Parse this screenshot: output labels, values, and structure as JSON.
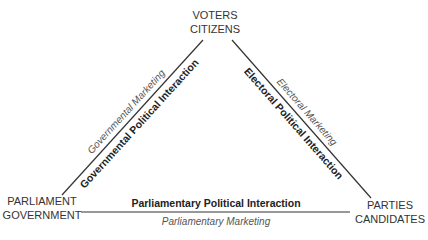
{
  "nodes": {
    "top": {
      "line1": "VOTERS",
      "line2": "CITIZENS"
    },
    "left": {
      "line1": "PARLIAMENT",
      "line2": "GOVERNMENT"
    },
    "right": {
      "line1": "PARTIES",
      "line2": "CANDIDATES"
    }
  },
  "edges": {
    "left": {
      "interaction": "Governmental Political Interaction",
      "marketing": "Governmental Marketing"
    },
    "right": {
      "interaction": "Electoral Political Interaction",
      "marketing": "Electoral Marketing"
    },
    "bottom": {
      "interaction": "Parliamentary Political Interaction",
      "marketing": "Parliamentary Marketing"
    }
  }
}
